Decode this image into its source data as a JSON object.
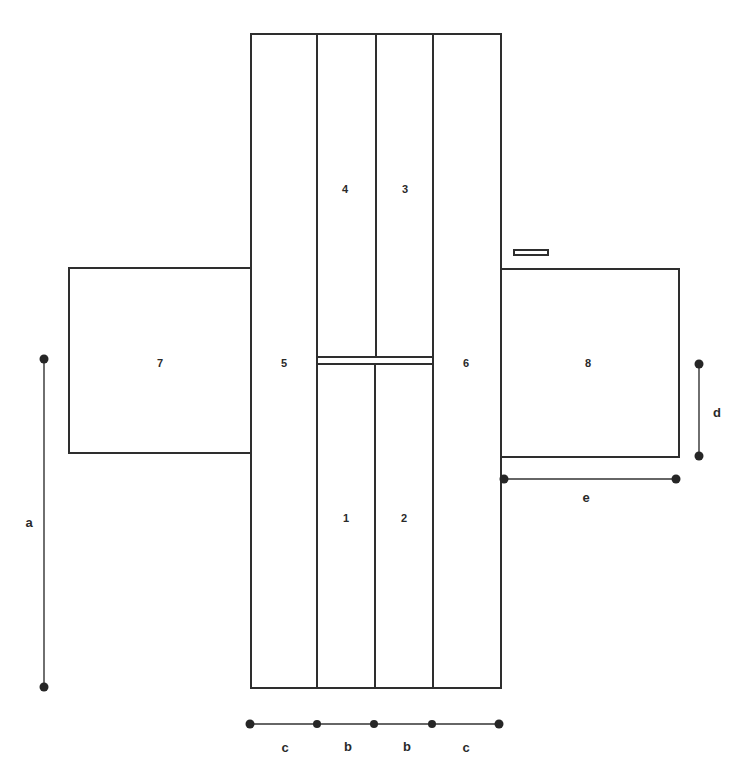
{
  "diagram": {
    "type": "floor-plan / panel layout",
    "colors": {
      "stroke": "#2e2e2e",
      "background": "#ffffff",
      "dot": "#262626"
    },
    "panels": [
      {
        "id": "1",
        "label": "1"
      },
      {
        "id": "2",
        "label": "2"
      },
      {
        "id": "3",
        "label": "3"
      },
      {
        "id": "4",
        "label": "4"
      },
      {
        "id": "5",
        "label": "5"
      },
      {
        "id": "6",
        "label": "6"
      },
      {
        "id": "7",
        "label": "7"
      },
      {
        "id": "8",
        "label": "8"
      }
    ],
    "dimensions": [
      {
        "id": "a",
        "label": "a",
        "orientation": "vertical"
      },
      {
        "id": "b1",
        "label": "b",
        "orientation": "horizontal"
      },
      {
        "id": "b2",
        "label": "b",
        "orientation": "horizontal"
      },
      {
        "id": "c1",
        "label": "c",
        "orientation": "horizontal"
      },
      {
        "id": "c2",
        "label": "c",
        "orientation": "horizontal"
      },
      {
        "id": "d",
        "label": "d",
        "orientation": "vertical"
      },
      {
        "id": "e",
        "label": "e",
        "orientation": "horizontal"
      }
    ]
  }
}
